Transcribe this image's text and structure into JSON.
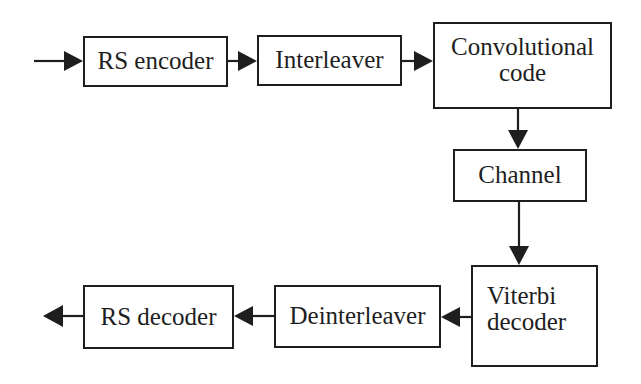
{
  "diagram": {
    "type": "block-diagram",
    "colors": {
      "stroke": "#1e1e1e",
      "background": "#ffffff"
    },
    "blocks": [
      {
        "id": "rs_encoder",
        "lines": [
          "RS encoder"
        ],
        "x": 83,
        "y": 36,
        "w": 145,
        "h": 51
      },
      {
        "id": "interleaver",
        "lines": [
          "Interleaver"
        ],
        "x": 257,
        "y": 35,
        "w": 145,
        "h": 51
      },
      {
        "id": "conv_code",
        "lines": [
          "Convolutional",
          "code"
        ],
        "x": 433,
        "y": 22,
        "w": 179,
        "h": 87
      },
      {
        "id": "channel",
        "lines": [
          "Channel"
        ],
        "x": 453,
        "y": 149,
        "w": 134,
        "h": 53
      },
      {
        "id": "viterbi",
        "lines": [
          "Viterbi",
          "decoder"
        ],
        "x": 471,
        "y": 265,
        "w": 127,
        "h": 102
      },
      {
        "id": "deinterleaver",
        "lines": [
          "Deinterleaver"
        ],
        "x": 274,
        "y": 285,
        "w": 167,
        "h": 63
      },
      {
        "id": "rs_decoder",
        "lines": [
          "RS decoder"
        ],
        "x": 83,
        "y": 285,
        "w": 151,
        "h": 64
      }
    ],
    "edges": [
      {
        "from": "input",
        "to": "rs_encoder"
      },
      {
        "from": "rs_encoder",
        "to": "interleaver"
      },
      {
        "from": "interleaver",
        "to": "conv_code"
      },
      {
        "from": "conv_code",
        "to": "channel"
      },
      {
        "from": "channel",
        "to": "viterbi"
      },
      {
        "from": "viterbi",
        "to": "deinterleaver"
      },
      {
        "from": "deinterleaver",
        "to": "rs_decoder"
      },
      {
        "from": "rs_decoder",
        "to": "output"
      }
    ]
  },
  "labels": {
    "rs_encoder": "RS encoder",
    "interleaver": "Interleaver",
    "conv_code_1": "Convolutional",
    "conv_code_2": "code",
    "channel": "Channel",
    "viterbi_1": "Viterbi",
    "viterbi_2": "decoder",
    "deinterleaver": "Deinterleaver",
    "rs_decoder": "RS decoder"
  }
}
